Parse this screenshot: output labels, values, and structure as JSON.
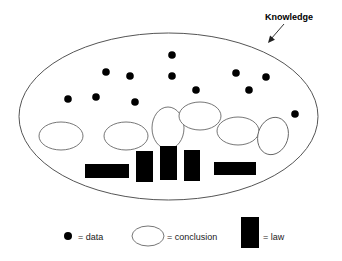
{
  "diagram": {
    "type": "venn-style-concept-diagram",
    "title_label": "Knowledge",
    "boundary": {
      "name": "knowledge-ellipse",
      "cx": 168.5,
      "cy": 116.5,
      "rx": 149.5,
      "ry": 83.5
    },
    "callout": {
      "label": "Knowledge",
      "label_x": 265,
      "label_y": 20,
      "arrow_from": [
        284,
        24
      ],
      "arrow_to": [
        268,
        43
      ]
    },
    "data_points": [
      {
        "cx": 172,
        "cy": 55,
        "r": 3.8
      },
      {
        "cx": 106,
        "cy": 72,
        "r": 3.8
      },
      {
        "cx": 130,
        "cy": 76,
        "r": 3.8
      },
      {
        "cx": 172,
        "cy": 76,
        "r": 3.8
      },
      {
        "cx": 236,
        "cy": 73,
        "r": 3.8
      },
      {
        "cx": 266,
        "cy": 77,
        "r": 3.8
      },
      {
        "cx": 68,
        "cy": 99,
        "r": 3.8
      },
      {
        "cx": 96,
        "cy": 97,
        "r": 3.8
      },
      {
        "cx": 135,
        "cy": 102,
        "r": 3.8
      },
      {
        "cx": 196,
        "cy": 90,
        "r": 3.8
      },
      {
        "cx": 249,
        "cy": 90,
        "r": 3.8
      },
      {
        "cx": 295,
        "cy": 114,
        "r": 3.8
      }
    ],
    "conclusions": [
      {
        "cx": 61,
        "cy": 136,
        "rx": 22,
        "ry": 14,
        "rot": 0
      },
      {
        "cx": 126,
        "cy": 136,
        "rx": 22,
        "ry": 14,
        "rot": 0
      },
      {
        "cx": 168,
        "cy": 128,
        "rx": 16,
        "ry": 21,
        "rot": 0
      },
      {
        "cx": 200,
        "cy": 116,
        "rx": 21,
        "ry": 14,
        "rot": 0
      },
      {
        "cx": 238,
        "cy": 131,
        "rx": 21,
        "ry": 14,
        "rot": 0
      },
      {
        "cx": 273,
        "cy": 136,
        "rx": 15,
        "ry": 19,
        "rot": 18
      }
    ],
    "laws": [
      {
        "x": 85,
        "y": 164,
        "w": 44,
        "h": 14
      },
      {
        "x": 136,
        "y": 151,
        "w": 17,
        "h": 31
      },
      {
        "x": 160,
        "y": 146,
        "w": 17,
        "h": 34
      },
      {
        "x": 184,
        "y": 150,
        "w": 16,
        "h": 31
      },
      {
        "x": 214,
        "y": 162,
        "w": 42,
        "h": 13
      }
    ]
  },
  "legend": {
    "items": [
      {
        "icon": "filled-circle-icon",
        "label": "= data",
        "icon_x": 68,
        "icon_y": 236,
        "icon_r": 4,
        "label_x": 78,
        "label_y": 240
      },
      {
        "icon": "open-ellipse-icon",
        "label": "= conclusion",
        "icon_cx": 148,
        "icon_cy": 236,
        "icon_rx": 16,
        "icon_ry": 10,
        "label_x": 167,
        "label_y": 240
      },
      {
        "icon": "filled-rect-icon",
        "label": "= law",
        "icon_x": 241,
        "icon_y": 217,
        "icon_w": 18,
        "icon_h": 31,
        "label_x": 263,
        "label_y": 240
      }
    ]
  },
  "colors": {
    "background": "#ffffff",
    "stroke": "#555555",
    "fill_black": "#000000",
    "text": "#1a1a1a"
  }
}
